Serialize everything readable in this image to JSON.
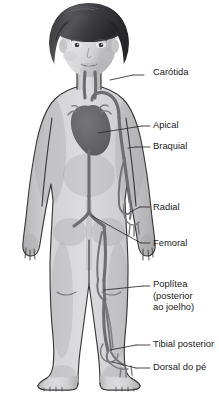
{
  "figure": {
    "background_color": "#ffffff",
    "line_color": "#2b2b2b",
    "vessel_color": "#6e6e72",
    "skin_color": "#cfcfd1",
    "hair_color": "#4a4a4e",
    "text_color": "#1a1a1a"
  },
  "labels": [
    {
      "id": "carotida",
      "lines": [
        "Carótida"
      ],
      "text_x": 153,
      "text_y": 73,
      "leader": "M 133 75 L 144 75",
      "pointer": "M 110 80 L 133 75"
    },
    {
      "id": "apical",
      "lines": [
        "Apical"
      ],
      "text_x": 153,
      "text_y": 126,
      "leader": "M 142 126 L 150 126",
      "pointer": "M 98 133 L 142 126"
    },
    {
      "id": "braquial",
      "lines": [
        "Braquial"
      ],
      "text_x": 153,
      "text_y": 147,
      "leader": "M 136 147 L 150 147",
      "pointer": "M 128 148 L 136 147"
    },
    {
      "id": "radial",
      "lines": [
        "Radial"
      ],
      "text_x": 153,
      "text_y": 208,
      "leader": "M 140 207 L 150 207",
      "pointer": "M 130 212 L 140 207"
    },
    {
      "id": "femoral",
      "lines": [
        "Femoral"
      ],
      "text_x": 153,
      "text_y": 244,
      "leader": "M 141 243 L 150 243",
      "pointer": "M 92 216 L 141 243"
    },
    {
      "id": "poplitea",
      "lines": [
        "Poplítea",
        "(posterior",
        "ao joelho)"
      ],
      "text_x": 153,
      "text_y": 285,
      "line_height": 11.5,
      "leader": "M 143 286 L 150 286",
      "pointer": "M 104 290 L 143 286"
    },
    {
      "id": "tibial-posterior",
      "lines": [
        "Tibial posterior"
      ],
      "text_x": 153,
      "text_y": 345,
      "leader": "M 136 345 L 150 345",
      "pointer": "M 110 350 L 136 345"
    },
    {
      "id": "dorsal-do-pe",
      "lines": [
        "Dorsal do pé"
      ],
      "text_x": 153,
      "text_y": 368,
      "leader": "M 136 368 L 150 368",
      "pointer": "M 112 362 L 136 368"
    }
  ]
}
